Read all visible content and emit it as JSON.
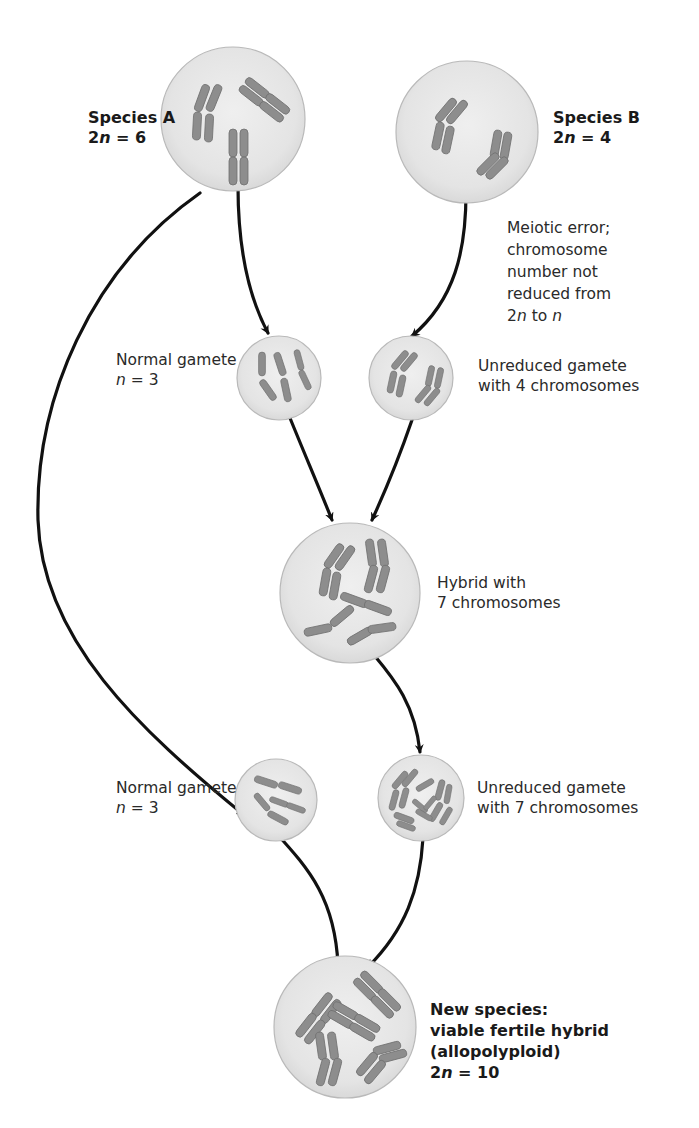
{
  "diagram": {
    "colors": {
      "cell_fill": "#e7e7e7",
      "cell_edge": "#b8b8b8",
      "chromosome": "#8d8d8d",
      "chromosome_edge": "#6f6f6f",
      "arrow": "#111111",
      "text": "#2a2a2a"
    },
    "nodes": {
      "species_a": {
        "label_line1": "Species A",
        "label_line2_prefix": "2",
        "label_line2_var": "n",
        "label_line2_suffix": " = 6",
        "chromosome_count": 6
      },
      "species_b": {
        "label_line1": "Species B",
        "label_line2_prefix": "2",
        "label_line2_var": "n",
        "label_line2_suffix": " = 4",
        "chromosome_count": 4
      },
      "meiotic_error": {
        "line1": "Meiotic error;",
        "line2": "chromosome",
        "line3": "number not",
        "line4": "reduced from",
        "line5_prefix": "2",
        "line5_var1": "n",
        "line5_mid": " to ",
        "line5_var2": "n"
      },
      "normal_gamete_1": {
        "label_line1": "Normal gamete",
        "label_line2_var": "n",
        "label_line2_suffix": " = 3",
        "chromosome_count": 3
      },
      "unreduced_gamete_4": {
        "label_line1": "Unreduced gamete",
        "label_line2": "with 4 chromosomes",
        "chromosome_count": 4
      },
      "hybrid_7": {
        "label_line1": "Hybrid with",
        "label_line2": "7 chromosomes",
        "chromosome_count": 7
      },
      "normal_gamete_2": {
        "label_line1": "Normal gamete",
        "label_line2_var": "n",
        "label_line2_suffix": " = 3",
        "chromosome_count": 3
      },
      "unreduced_gamete_7": {
        "label_line1": "Unreduced gamete",
        "label_line2": "with 7 chromosomes",
        "chromosome_count": 7
      },
      "new_species": {
        "label_line1": "New species:",
        "label_line2": "viable fertile hybrid",
        "label_line3": "(allopolyploid)",
        "label_line4_prefix": "2",
        "label_line4_var": "n",
        "label_line4_suffix": " = 10",
        "chromosome_count": 10
      }
    },
    "edges": [
      {
        "from": "species_a",
        "to": "normal_gamete_1"
      },
      {
        "from": "species_a",
        "to": "normal_gamete_2"
      },
      {
        "from": "species_b",
        "to": "unreduced_gamete_4"
      },
      {
        "from": "normal_gamete_1",
        "to": "hybrid_7"
      },
      {
        "from": "unreduced_gamete_4",
        "to": "hybrid_7"
      },
      {
        "from": "hybrid_7",
        "to": "unreduced_gamete_7"
      },
      {
        "from": "normal_gamete_2",
        "to": "new_species"
      },
      {
        "from": "unreduced_gamete_7",
        "to": "new_species"
      }
    ]
  }
}
